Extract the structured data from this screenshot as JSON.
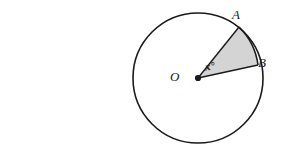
{
  "figure": {
    "type": "circle-sector-diagram",
    "width": 282,
    "height": 155,
    "background_color": "#ffffff"
  },
  "circle": {
    "center_label": "O",
    "center_x": 198,
    "center_y": 78,
    "radius": 65,
    "stroke_color": "#1a1a1a",
    "stroke_width": 1.5,
    "fill_color": "#ffffff"
  },
  "points": [
    {
      "label": "A",
      "x": 239,
      "y": 27,
      "angle_deg": 51
    },
    {
      "label": "B",
      "x": 258,
      "y": 65,
      "angle_deg": 11
    },
    {
      "label": "O",
      "x": 198,
      "y": 78,
      "angle_deg": null
    }
  ],
  "sector": {
    "from_point": "A",
    "to_point": "B",
    "fill_color": "#d4d4d4",
    "stroke_color": "#1a1a1a",
    "angle_label": "x°"
  },
  "labels": {
    "center": "O",
    "point_a": "A",
    "point_b": "B",
    "angle": "x°"
  },
  "colors": {
    "ink": "#1a1a1a",
    "shade": "#d4d4d4",
    "paper": "#ffffff"
  }
}
